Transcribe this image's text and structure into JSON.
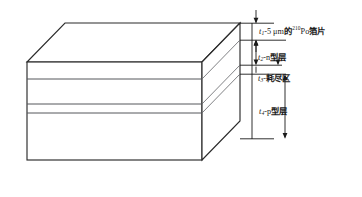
{
  "figure": {
    "kind": "isometric-layer-stack-diagram",
    "colors": {
      "outline": "#2b2b2b",
      "layer_divider": "#4a4a4a",
      "dimension_line": "#1a1a1a",
      "text": "#1a1a1a",
      "background": "#ffffff"
    }
  },
  "callouts": [
    {
      "id": "foil",
      "symbol": "t",
      "subscript": "1",
      "separator": "-",
      "value": "5",
      "unit": "μm",
      "connector": "的",
      "isotope_mass": "210",
      "isotope_symbol": "Po",
      "material": "箔片",
      "full_text": "t1-5 μm的210Po箔片"
    },
    {
      "id": "ntype",
      "symbol": "t",
      "subscript": "2",
      "separator": "-",
      "material": "n型层",
      "full_text": "t2-n型层"
    },
    {
      "id": "depletion",
      "symbol": "t",
      "subscript": "3",
      "separator": "-",
      "material": "耗尽区",
      "full_text": "t3-耗尽区"
    },
    {
      "id": "ptype",
      "symbol": "t",
      "subscript": "4",
      "separator": "-",
      "material": "p型层",
      "full_text": "t4-p型层"
    }
  ]
}
